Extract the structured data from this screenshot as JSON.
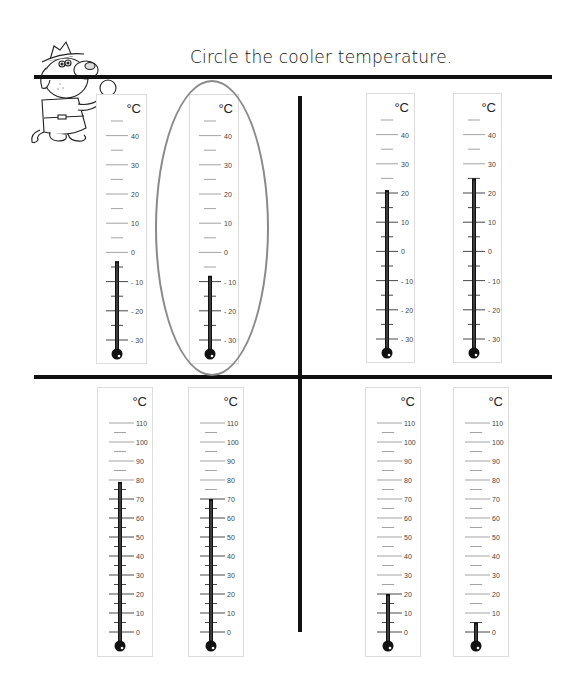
{
  "worksheet": {
    "title": "Circle the cooler temperature.",
    "unit": "°C",
    "mascot": "cartoon-detective-dog-with-magnifying-glass",
    "circle_color": "#8a8a8a"
  },
  "pairs": [
    {
      "position": "top-left",
      "scale": {
        "min": -30,
        "max": 40,
        "labels": [
          "40",
          "30",
          "20",
          "10",
          "0",
          "- 10",
          "- 20",
          "- 30"
        ]
      },
      "thermometers": [
        {
          "id": "t1",
          "reading": -3,
          "circled": false
        },
        {
          "id": "t2",
          "reading": -8,
          "circled": true
        }
      ]
    },
    {
      "position": "top-right",
      "scale": {
        "min": -30,
        "max": 40,
        "labels": [
          "40",
          "30",
          "20",
          "10",
          "0",
          "- 10",
          "- 20",
          "- 30"
        ]
      },
      "thermometers": [
        {
          "id": "t3",
          "reading": 21,
          "circled": false
        },
        {
          "id": "t4",
          "reading": 25,
          "circled": false
        }
      ]
    },
    {
      "position": "bottom-left",
      "scale": {
        "min": 0,
        "max": 110,
        "labels": [
          "110",
          "100",
          "90",
          "80",
          "70",
          "60",
          "50",
          "40",
          "30",
          "20",
          "10",
          "0"
        ]
      },
      "thermometers": [
        {
          "id": "t5",
          "reading": 79,
          "circled": false
        },
        {
          "id": "t6",
          "reading": 70,
          "circled": false
        }
      ]
    },
    {
      "position": "bottom-right",
      "scale": {
        "min": 0,
        "max": 110,
        "labels": [
          "110",
          "100",
          "90",
          "80",
          "70",
          "60",
          "50",
          "40",
          "30",
          "20",
          "10",
          "0"
        ]
      },
      "thermometers": [
        {
          "id": "t7",
          "reading": 20,
          "circled": false
        },
        {
          "id": "t8",
          "reading": 5,
          "circled": false
        }
      ]
    }
  ]
}
